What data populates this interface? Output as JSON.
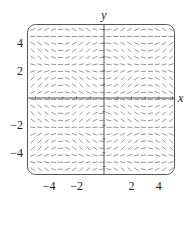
{
  "chart_data": {
    "type": "slope_field",
    "title": "",
    "xlabel": "x",
    "ylabel": "y",
    "xlim": [
      -5.6,
      5.2
    ],
    "ylim": [
      -5.5,
      5.4
    ],
    "x_ticks": [
      -4,
      -2,
      2,
      4
    ],
    "y_ticks": [
      -4,
      -2,
      2,
      4
    ],
    "x_tick_labels": [
      "−4",
      "−2",
      "2",
      "4"
    ],
    "y_tick_labels": [
      "−4",
      "−2",
      "2",
      "4"
    ],
    "grid": false,
    "frame": "rounded-box",
    "field": "dy/dx = sin(x) sin(1.4 y)",
    "samples_x": 21,
    "samples_y": 21,
    "segment_color": "#8a8a8a",
    "axis_color": "#555555"
  }
}
